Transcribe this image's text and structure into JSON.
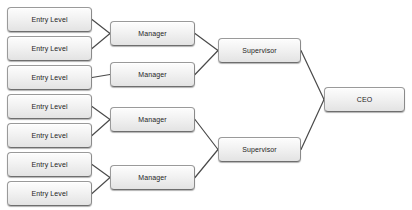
{
  "diagram": {
    "type": "org-chart",
    "background_color": "#ffffff",
    "node_fill_top": "#fdfdfd",
    "node_fill_bottom": "#e3e3e3",
    "node_border_color": "#9a9a9a",
    "connector_color": "#4a4a4a",
    "levels": [
      {
        "name": "entry",
        "label": "Entry Level",
        "count": 7
      },
      {
        "name": "manager",
        "label": "Manager",
        "count": 4
      },
      {
        "name": "supervisor",
        "label": "Supervisor",
        "count": 2
      },
      {
        "name": "ceo",
        "label": "CEO",
        "count": 1
      }
    ],
    "nodes": [
      {
        "id": "entry-1",
        "label": "Entry Level",
        "level": "entry",
        "x": 7,
        "y": 7,
        "w": 85,
        "h": 25
      },
      {
        "id": "entry-2",
        "label": "Entry Level",
        "level": "entry",
        "x": 7,
        "y": 36,
        "w": 85,
        "h": 25
      },
      {
        "id": "entry-3",
        "label": "Entry Level",
        "level": "entry",
        "x": 7,
        "y": 65,
        "w": 85,
        "h": 25
      },
      {
        "id": "entry-4",
        "label": "Entry Level",
        "level": "entry",
        "x": 7,
        "y": 94,
        "w": 85,
        "h": 25
      },
      {
        "id": "entry-5",
        "label": "Entry Level",
        "level": "entry",
        "x": 7,
        "y": 123,
        "w": 85,
        "h": 25
      },
      {
        "id": "entry-6",
        "label": "Entry Level",
        "level": "entry",
        "x": 7,
        "y": 152,
        "w": 85,
        "h": 25
      },
      {
        "id": "entry-7",
        "label": "Entry Level",
        "level": "entry",
        "x": 7,
        "y": 181,
        "w": 85,
        "h": 25
      },
      {
        "id": "manager-1",
        "label": "Manager",
        "level": "manager",
        "x": 110,
        "y": 21,
        "w": 85,
        "h": 25
      },
      {
        "id": "manager-2",
        "label": "Manager",
        "level": "manager",
        "x": 110,
        "y": 62,
        "w": 85,
        "h": 25
      },
      {
        "id": "manager-3",
        "label": "Manager",
        "level": "manager",
        "x": 110,
        "y": 107,
        "w": 85,
        "h": 25
      },
      {
        "id": "manager-4",
        "label": "Manager",
        "level": "manager",
        "x": 110,
        "y": 165,
        "w": 85,
        "h": 25
      },
      {
        "id": "supervisor-1",
        "label": "Supervisor",
        "level": "supervisor",
        "x": 218,
        "y": 38,
        "w": 83,
        "h": 25
      },
      {
        "id": "supervisor-2",
        "label": "Supervisor",
        "level": "supervisor",
        "x": 218,
        "y": 137,
        "w": 83,
        "h": 25
      },
      {
        "id": "ceo-1",
        "label": "CEO",
        "level": "ceo",
        "x": 324,
        "y": 87,
        "w": 81,
        "h": 25
      }
    ],
    "connections": [
      {
        "from": "entry-1",
        "to": "manager-1"
      },
      {
        "from": "entry-2",
        "to": "manager-1"
      },
      {
        "from": "entry-3",
        "to": "manager-2"
      },
      {
        "from": "entry-4",
        "to": "manager-3"
      },
      {
        "from": "entry-5",
        "to": "manager-3"
      },
      {
        "from": "entry-6",
        "to": "manager-4"
      },
      {
        "from": "entry-7",
        "to": "manager-4"
      },
      {
        "from": "manager-1",
        "to": "supervisor-1"
      },
      {
        "from": "manager-2",
        "to": "supervisor-1"
      },
      {
        "from": "manager-3",
        "to": "supervisor-2"
      },
      {
        "from": "manager-4",
        "to": "supervisor-2"
      },
      {
        "from": "supervisor-1",
        "to": "ceo-1"
      },
      {
        "from": "supervisor-2",
        "to": "ceo-1"
      }
    ]
  }
}
